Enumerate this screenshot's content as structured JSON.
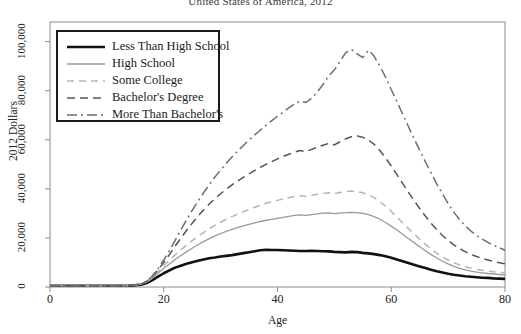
{
  "chart_data": {
    "type": "line",
    "title": "United States of America, 2012",
    "xlabel": "Age",
    "ylabel": "2012 Dollars",
    "xlim": [
      0,
      80
    ],
    "ylim": [
      0,
      108000
    ],
    "grid": false,
    "legend_position": "top-left",
    "xticks": [
      0,
      20,
      40,
      60,
      80
    ],
    "xtick_labels": [
      "0",
      "20",
      "40",
      "60",
      "80"
    ],
    "yticks": [
      0,
      20000,
      40000,
      60000,
      80000,
      100000
    ],
    "ytick_labels": [
      "0",
      "20,000",
      "40,000",
      "60,000",
      "80,000",
      "100,000"
    ],
    "x": [
      0,
      2,
      4,
      6,
      8,
      10,
      12,
      14,
      16,
      17,
      18,
      19,
      20,
      21,
      22,
      23,
      24,
      25,
      26,
      27,
      28,
      29,
      30,
      31,
      32,
      33,
      34,
      35,
      36,
      37,
      38,
      39,
      40,
      41,
      42,
      43,
      44,
      45,
      46,
      47,
      48,
      49,
      50,
      51,
      52,
      53,
      54,
      55,
      56,
      57,
      58,
      59,
      60,
      61,
      62,
      63,
      64,
      65,
      66,
      67,
      68,
      69,
      70,
      71,
      72,
      73,
      74,
      75,
      76,
      77,
      78,
      79,
      80
    ],
    "series": [
      {
        "name": "Less Than High School",
        "style": "solid",
        "color": "#111111",
        "width": 2.6,
        "values": [
          500,
          500,
          500,
          500,
          500,
          500,
          500,
          550,
          900,
          1600,
          2800,
          4200,
          5600,
          6800,
          7900,
          8700,
          9500,
          10100,
          10700,
          11200,
          11700,
          12000,
          12400,
          12700,
          13000,
          13400,
          13800,
          14200,
          14600,
          15000,
          15200,
          15100,
          15100,
          15000,
          14900,
          14800,
          14700,
          14700,
          14800,
          14700,
          14600,
          14500,
          14300,
          14200,
          14100,
          14300,
          14200,
          13900,
          13700,
          13400,
          13000,
          12500,
          11900,
          11200,
          10500,
          9800,
          9100,
          8400,
          7700,
          7000,
          6400,
          5900,
          5400,
          5000,
          4700,
          4400,
          4200,
          4000,
          3800,
          3700,
          3500,
          3400,
          3300
        ]
      },
      {
        "name": "High School",
        "style": "solid",
        "color": "#9a9a9a",
        "width": 1.3,
        "values": [
          500,
          500,
          500,
          500,
          500,
          500,
          500,
          600,
          1100,
          2000,
          3600,
          5600,
          7600,
          9400,
          11200,
          12800,
          14300,
          15800,
          17200,
          18500,
          19700,
          20800,
          21800,
          22700,
          23500,
          24200,
          24900,
          25500,
          26100,
          26700,
          27200,
          27600,
          28000,
          28400,
          28800,
          29200,
          29400,
          29200,
          29500,
          29800,
          30100,
          30200,
          29900,
          30100,
          30300,
          30400,
          30300,
          30000,
          29500,
          28700,
          27600,
          26300,
          24800,
          23200,
          21500,
          19800,
          18100,
          16400,
          14800,
          13200,
          11800,
          10500,
          9400,
          8400,
          7600,
          7000,
          6500,
          6100,
          5800,
          5500,
          5300,
          5100,
          4900
        ]
      },
      {
        "name": "Some College",
        "style": "dashed-light",
        "color": "#b5b5b5",
        "width": 1.5,
        "values": [
          500,
          500,
          500,
          500,
          500,
          500,
          500,
          600,
          1200,
          2200,
          4000,
          6300,
          8700,
          10900,
          13100,
          15100,
          17000,
          18900,
          20600,
          22200,
          23700,
          25100,
          26400,
          27600,
          28700,
          29700,
          30700,
          31600,
          32500,
          33300,
          34100,
          34700,
          35300,
          35900,
          36400,
          36900,
          37200,
          37000,
          37400,
          37800,
          38100,
          38400,
          38100,
          38500,
          38900,
          39100,
          38900,
          38400,
          37600,
          36400,
          34800,
          32900,
          30800,
          28500,
          26200,
          23900,
          21600,
          19400,
          17400,
          15500,
          13800,
          12300,
          11000,
          9900,
          9000,
          8300,
          7700,
          7200,
          6800,
          6500,
          6200,
          6000,
          5800
        ]
      },
      {
        "name": "Bachelor's Degree",
        "style": "dashed-medium",
        "color": "#555555",
        "width": 1.5,
        "values": [
          500,
          500,
          500,
          500,
          500,
          500,
          500,
          600,
          1200,
          2300,
          4300,
          7000,
          10000,
          13200,
          16600,
          19900,
          23000,
          26000,
          28800,
          31400,
          33800,
          36000,
          38000,
          39900,
          41600,
          43200,
          44700,
          46100,
          47500,
          48800,
          50000,
          51100,
          52200,
          53200,
          54100,
          55000,
          55600,
          55200,
          56100,
          57000,
          57800,
          58500,
          57900,
          59200,
          60400,
          61200,
          61500,
          61000,
          59900,
          58100,
          55600,
          52600,
          49300,
          45800,
          42200,
          38700,
          35300,
          32000,
          28900,
          26000,
          23400,
          21000,
          19000,
          17200,
          15700,
          14400,
          13300,
          12400,
          11600,
          11000,
          10400,
          9900,
          9500
        ]
      },
      {
        "name": "More Than Bachelor's",
        "style": "dash-dot",
        "color": "#6e6e6e",
        "width": 1.5,
        "values": [
          500,
          500,
          500,
          500,
          500,
          500,
          500,
          600,
          1200,
          2400,
          4500,
          7500,
          11000,
          14800,
          19000,
          23200,
          27300,
          31200,
          34900,
          38400,
          41700,
          44800,
          47700,
          50400,
          53000,
          55400,
          57700,
          59900,
          62000,
          64000,
          66000,
          67800,
          69600,
          71300,
          73000,
          74600,
          75800,
          75200,
          77000,
          79500,
          82500,
          86000,
          88500,
          92000,
          95500,
          96800,
          95000,
          93500,
          96500,
          94000,
          90000,
          85500,
          80500,
          75500,
          70500,
          65500,
          60500,
          55800,
          51000,
          46500,
          42000,
          38000,
          34000,
          30500,
          27500,
          25000,
          22800,
          21000,
          19500,
          18200,
          17000,
          16000,
          15000
        ]
      }
    ]
  },
  "legend": {
    "items": [
      {
        "label": "Less Than High School"
      },
      {
        "label": "High School"
      },
      {
        "label": "Some College"
      },
      {
        "label": "Bachelor's Degree"
      },
      {
        "label": "More Than Bachelor's"
      }
    ]
  }
}
